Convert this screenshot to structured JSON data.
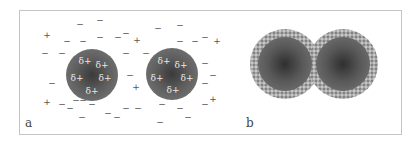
{
  "figure": {
    "panels": [
      {
        "id": "a",
        "label": "a",
        "description": "Charged particles with delta-positive surface surrounded by free ions",
        "particles": [
          {
            "cx": 92,
            "cy": 75,
            "r": 26,
            "surface_charges": [
              {
                "text": "δ+",
                "x": 85,
                "y": 61
              },
              {
                "text": "δ+",
                "x": 102,
                "y": 65
              },
              {
                "text": "δ+",
                "x": 77,
                "y": 78
              },
              {
                "text": "δ+",
                "x": 105,
                "y": 78
              },
              {
                "text": "δ+",
                "x": 92,
                "y": 91
              }
            ]
          },
          {
            "cx": 172,
            "cy": 74,
            "r": 26,
            "surface_charges": [
              {
                "text": "δ+",
                "x": 164,
                "y": 61
              },
              {
                "text": "δ+",
                "x": 181,
                "y": 65
              },
              {
                "text": "δ+",
                "x": 157,
                "y": 78
              },
              {
                "text": "δ+",
                "x": 187,
                "y": 78
              },
              {
                "text": "δ+",
                "x": 173,
                "y": 90
              }
            ]
          }
        ],
        "free_charges": [
          {
            "text": "−",
            "x": 80,
            "y": 24
          },
          {
            "text": "−",
            "x": 100,
            "y": 20
          },
          {
            "text": "+",
            "x": 47,
            "y": 35
          },
          {
            "text": "−",
            "x": 67,
            "y": 41
          },
          {
            "text": "−",
            "x": 83,
            "y": 41
          },
          {
            "text": "−",
            "x": 100,
            "y": 37
          },
          {
            "text": "−",
            "x": 118,
            "y": 37
          },
          {
            "text": "−",
            "x": 126,
            "y": 33
          },
          {
            "text": "+",
            "x": 137,
            "y": 40
          },
          {
            "text": "−",
            "x": 45,
            "y": 53
          },
          {
            "text": "−",
            "x": 62,
            "y": 53
          },
          {
            "text": "−",
            "x": 126,
            "y": 53
          },
          {
            "text": "−",
            "x": 146,
            "y": 53
          },
          {
            "text": "−",
            "x": 52,
            "y": 83
          },
          {
            "text": "−",
            "x": 130,
            "y": 75
          },
          {
            "text": "+",
            "x": 136,
            "y": 87
          },
          {
            "text": "+",
            "x": 47,
            "y": 102
          },
          {
            "text": "−",
            "x": 62,
            "y": 104
          },
          {
            "text": "−",
            "x": 70,
            "y": 108
          },
          {
            "text": "−",
            "x": 76,
            "y": 100
          },
          {
            "text": "−",
            "x": 83,
            "y": 100
          },
          {
            "text": "−",
            "x": 92,
            "y": 104
          },
          {
            "text": "−",
            "x": 82,
            "y": 117
          },
          {
            "text": "−",
            "x": 108,
            "y": 113
          },
          {
            "text": "−",
            "x": 117,
            "y": 117
          },
          {
            "text": "−",
            "x": 126,
            "y": 108
          },
          {
            "text": "−",
            "x": 138,
            "y": 108
          },
          {
            "text": "−",
            "x": 158,
            "y": 28
          },
          {
            "text": "−",
            "x": 180,
            "y": 25
          },
          {
            "text": "−",
            "x": 180,
            "y": 41
          },
          {
            "text": "−",
            "x": 195,
            "y": 41
          },
          {
            "text": "−",
            "x": 205,
            "y": 37
          },
          {
            "text": "−",
            "x": 205,
            "y": 63
          },
          {
            "text": "−",
            "x": 213,
            "y": 75
          },
          {
            "text": "−",
            "x": 205,
            "y": 83
          },
          {
            "text": "−",
            "x": 205,
            "y": 104
          },
          {
            "text": "−",
            "x": 162,
            "y": 104
          },
          {
            "text": "−",
            "x": 180,
            "y": 108
          },
          {
            "text": "−",
            "x": 160,
            "y": 122
          },
          {
            "text": "−",
            "x": 188,
            "y": 117
          },
          {
            "text": "+",
            "x": 217,
            "y": 41
          },
          {
            "text": "+",
            "x": 213,
            "y": 99
          }
        ]
      },
      {
        "id": "b",
        "label": "b",
        "description": "Two particles with adsorbed shells in contact",
        "particles": [
          {
            "cx": 285,
            "cy": 64,
            "outer_r": 35,
            "inner_r": 27
          },
          {
            "cx": 343,
            "cy": 64,
            "outer_r": 35,
            "inner_r": 27
          }
        ]
      }
    ],
    "colors": {
      "frame": "#c4c4c4",
      "particle_core": "#5e5e5e",
      "shell": "#a9a9a9",
      "charge_text": "#555555",
      "delta_text": "#e8e8e8"
    }
  }
}
